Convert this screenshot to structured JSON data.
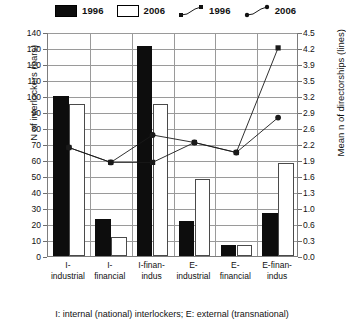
{
  "legend": {
    "items": [
      {
        "label": "1996",
        "marker": "filled-square-swatch"
      },
      {
        "label": "2006",
        "marker": "hollow-square-swatch"
      },
      {
        "label": "1996",
        "marker": "line-square-marker"
      },
      {
        "label": "2006",
        "marker": "line-circle-marker"
      }
    ]
  },
  "axes": {
    "left_title": "N of interlockers (bars)",
    "right_title": "Mean n of directorships (lines)",
    "left_ticks": [
      "140",
      "130",
      "120",
      "110",
      "100",
      "90",
      "80",
      "70",
      "60",
      "50",
      "40",
      "30",
      "20",
      "10",
      "0"
    ],
    "right_ticks": [
      "4.5",
      "4.2",
      "3.9",
      "3.5",
      "3.2",
      "2.9",
      "2.6",
      "2.2",
      "1.9",
      "1.6",
      "1.3",
      "1.0",
      "0.6",
      "0.3",
      "0.0"
    ]
  },
  "caption": "I: internal (national) interlockers; E: external (transnational)",
  "categories_display": [
    [
      "I-",
      "industrial"
    ],
    [
      "I-",
      "financial"
    ],
    [
      "I-finan-",
      "indus"
    ],
    [
      "E-",
      "industrial"
    ],
    [
      "E-",
      "financial"
    ],
    [
      "E-finan-",
      "indus"
    ]
  ],
  "colors": {
    "bar_1996": "#0d0d0d",
    "bar_2006": "#ffffff",
    "bar_2006_border": "#4a4a4a",
    "line": "#1a1a1a",
    "grid": "#9a9a9a",
    "axis": "#7d7d7d"
  },
  "chart_data": {
    "type": "bar",
    "title": "",
    "xlabel": "",
    "ylabel": "N of interlockers (bars)",
    "y2label": "Mean n of directorships (lines)",
    "ylim": [
      0,
      140
    ],
    "y2lim": [
      0.0,
      4.5
    ],
    "grid": true,
    "legend_position": "top",
    "categories": [
      "I-industrial",
      "I-financial",
      "I-finan-indus",
      "E-industrial",
      "E-financial",
      "E-finan-indus"
    ],
    "series": [
      {
        "name": "1996",
        "type": "bar",
        "axis": "left",
        "values": [
          100,
          23,
          131,
          22,
          7,
          27
        ]
      },
      {
        "name": "2006",
        "type": "bar",
        "axis": "left",
        "values": [
          95,
          12,
          95,
          48,
          7,
          58
        ]
      },
      {
        "name": "1996",
        "type": "line",
        "axis": "right",
        "marker": "square",
        "values": [
          2.2,
          1.9,
          1.9,
          2.3,
          2.1,
          4.2
        ]
      },
      {
        "name": "2006",
        "type": "line",
        "axis": "right",
        "marker": "circle",
        "values": [
          2.2,
          1.9,
          2.45,
          2.3,
          2.1,
          2.8
        ]
      }
    ]
  }
}
